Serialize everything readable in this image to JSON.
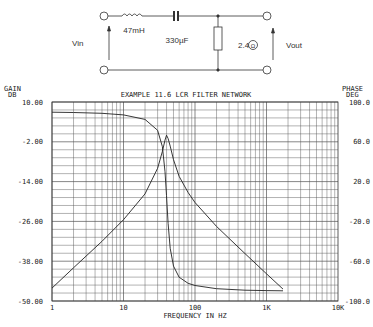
{
  "circuit": {
    "inductor_label": "47mH",
    "capacitor_label": "330µF",
    "resistor_label": "2.4",
    "resistor_unit_symbol": "Ω",
    "input_label": "Vin",
    "output_label": "Vout"
  },
  "chart_data": {
    "type": "line",
    "title": "EXAMPLE 11.6  LCR FILTER NETWORK",
    "xlabel": "FREQUENCY IN HZ",
    "ylabel_left": [
      "GAIN",
      "DB"
    ],
    "ylabel_right": [
      "PHASE",
      "DEG"
    ],
    "xscale": "log",
    "xlim": [
      1,
      10000
    ],
    "ylim_left": [
      -50,
      10
    ],
    "ylim_right": [
      -100,
      100
    ],
    "grid": true,
    "x_ticks": [
      "1",
      "10",
      "100",
      "1K",
      "10K"
    ],
    "y_ticks_left": [
      "10.00",
      "-2.00",
      "-14.00",
      "-26.00",
      "-38.00",
      "-50.00"
    ],
    "y_ticks_right": [
      "100.0",
      "60.0",
      "20.0",
      "-20.0",
      "-60.0",
      "-100.0"
    ],
    "x": [
      1,
      2,
      5,
      10,
      20,
      30,
      35,
      38,
      40,
      42,
      45,
      50,
      60,
      80,
      100,
      200,
      500,
      1000,
      1700
    ],
    "series": [
      {
        "name": "Gain (dB)",
        "axis": "left",
        "values": [
          -46.1,
          -40.0,
          -32.0,
          -25.5,
          -17.7,
          -10.0,
          -4.9,
          -1.5,
          0.0,
          -1.0,
          -3.3,
          -7.4,
          -12.4,
          -17.3,
          -20.3,
          -27.5,
          -35.7,
          -41.8,
          -46.4
        ]
      },
      {
        "name": "Phase (deg)",
        "axis": "right",
        "values": [
          89.7,
          89.4,
          88.6,
          87.0,
          82.5,
          71.6,
          55.1,
          30.0,
          5.9,
          -22.0,
          -47.0,
          -64.9,
          -76.1,
          -82.2,
          -84.4,
          -87.6,
          -89.1,
          -89.5,
          -89.7
        ]
      }
    ]
  }
}
